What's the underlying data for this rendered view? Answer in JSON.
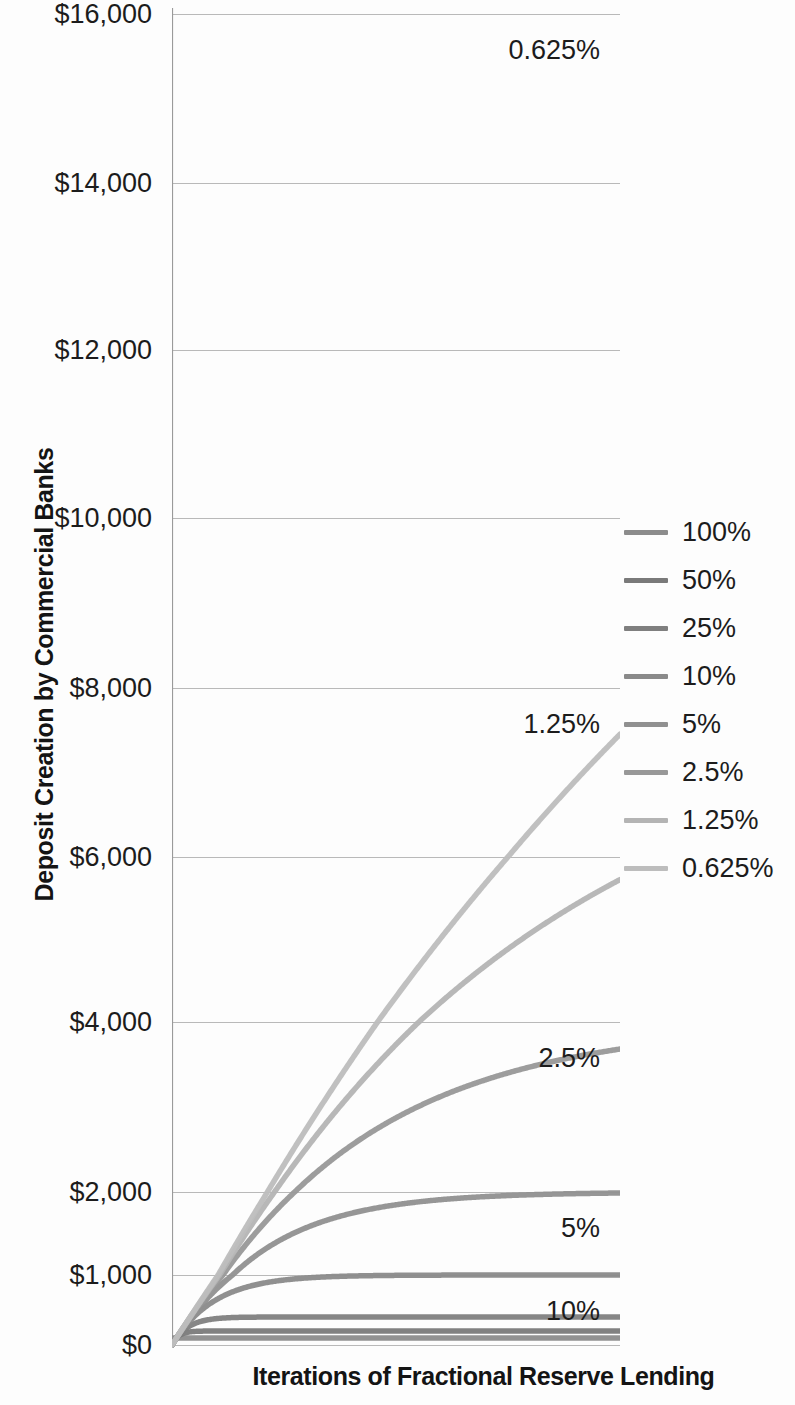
{
  "chart_data": {
    "type": "line",
    "title": "",
    "xlabel": "Iterations of Fractional Reserve Lending",
    "ylabel": "Deposit Creation by Commercial Banks",
    "grid": true,
    "legend_position": "right",
    "x": [
      0,
      1,
      2,
      3,
      4,
      5,
      6,
      7,
      8,
      9,
      10,
      11,
      12,
      13,
      14,
      15,
      16,
      17,
      18,
      19,
      20,
      22,
      24,
      26,
      28,
      30,
      34,
      38,
      42,
      46,
      50,
      60,
      70,
      80,
      90,
      100
    ],
    "xlim": [
      0,
      100
    ],
    "ylim": [
      0,
      16000
    ],
    "y_tick_labels": [
      "$16,000",
      "$14,000",
      "$12,000",
      "$10,000",
      "$8,000",
      "$6,000",
      "$4,000",
      "$2,000",
      "$1,000",
      "$0"
    ],
    "y_tick_values": [
      16000,
      14000,
      12000,
      10000,
      8000,
      6000,
      4000,
      2000,
      1000,
      0
    ],
    "y_axis_scale": "non-linear (compressed below $2,000)",
    "series": [
      {
        "name": "100%",
        "reserve_ratio": 1.0,
        "asymptote": 100,
        "color": "#8c8c8c"
      },
      {
        "name": "50%",
        "reserve_ratio": 0.5,
        "asymptote": 200,
        "color": "#7a7a7a"
      },
      {
        "name": "25%",
        "reserve_ratio": 0.25,
        "asymptote": 400,
        "color": "#7f7f7f"
      },
      {
        "name": "10%",
        "reserve_ratio": 0.1,
        "asymptote": 1000,
        "color": "#8a8a8a"
      },
      {
        "name": "5%",
        "reserve_ratio": 0.05,
        "asymptote": 2000,
        "color": "#909090"
      },
      {
        "name": "2.5%",
        "reserve_ratio": 0.025,
        "asymptote": 4000,
        "color": "#989898"
      },
      {
        "name": "1.25%",
        "reserve_ratio": 0.0125,
        "asymptote": 8000,
        "color": "#b4b4b4"
      },
      {
        "name": "0.625%",
        "reserve_ratio": 0.00625,
        "asymptote": 16000,
        "color": "#bdbdbd"
      }
    ],
    "annotations": [
      {
        "label": "0.625%",
        "value": 16000
      },
      {
        "label": "1.25%",
        "value": 8000
      },
      {
        "label": "2.5%",
        "value": 4000
      },
      {
        "label": "5%",
        "value": 2000
      },
      {
        "label": "10%",
        "value": 1000
      }
    ]
  },
  "axis": {
    "y_title": "Deposit Creation by Commercial Banks",
    "x_title": "Iterations of Fractional Reserve Lending",
    "y_ticks": [
      {
        "label": "$16,000"
      },
      {
        "label": "$14,000"
      },
      {
        "label": "$12,000"
      },
      {
        "label": "$10,000"
      },
      {
        "label": "$8,000"
      },
      {
        "label": "$6,000"
      },
      {
        "label": "$4,000"
      },
      {
        "label": "$2,000"
      },
      {
        "label": "$1,000"
      },
      {
        "label": "$0"
      }
    ]
  },
  "legend": {
    "items": [
      {
        "label": "100%"
      },
      {
        "label": "50%"
      },
      {
        "label": "25%"
      },
      {
        "label": "10%"
      },
      {
        "label": "5%"
      },
      {
        "label": "2.5%"
      },
      {
        "label": "1.25%"
      },
      {
        "label": "0.625%"
      }
    ]
  },
  "annotations": [
    {
      "label": "0.625%"
    },
    {
      "label": "1.25%"
    },
    {
      "label": "2.5%"
    },
    {
      "label": "5%"
    },
    {
      "label": "10%"
    }
  ],
  "colors": {
    "grid": "#b9b9b9",
    "axis": "#9a9a9a",
    "text": "#1c1c1c",
    "background": "#fdfdfd"
  }
}
